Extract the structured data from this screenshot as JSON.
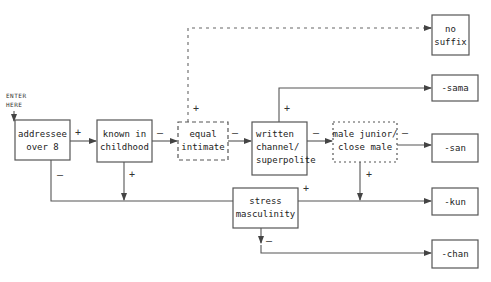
{
  "entry": {
    "line1": "ENTER",
    "line2": "HERE"
  },
  "nodes": {
    "addressee": {
      "line1": "addressee",
      "line2": "over 8"
    },
    "known": {
      "line1": "known in",
      "line2": "childhood"
    },
    "equal": {
      "line1": "equal",
      "line2": "intimate"
    },
    "written": {
      "line1": "written",
      "line2": "channel/",
      "line3": "superpolite"
    },
    "male": {
      "line1": "male junior/",
      "line2": "close male"
    },
    "stress": {
      "line1": "stress",
      "line2": "masculinity"
    }
  },
  "outcomes": {
    "no_suffix": {
      "line1": "no",
      "line2": "suffix"
    },
    "sama": {
      "label": "-sama"
    },
    "san": {
      "label": "-san"
    },
    "kun": {
      "label": "-kun"
    },
    "chan": {
      "label": "-chan"
    }
  },
  "signs": {
    "plus": "+",
    "minus": "–"
  }
}
